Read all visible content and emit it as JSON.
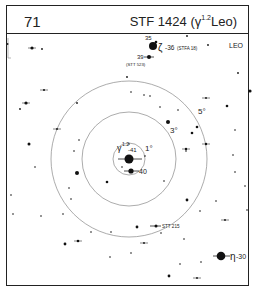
{
  "header": {
    "chart_number": "71",
    "title_prefix": "STF 1424 (",
    "title_greek": "γ",
    "title_sup": "1.2",
    "title_suffix": "Leo)"
  },
  "constellation_label": "LEO",
  "rings": [
    {
      "label": "1°",
      "r": 16
    },
    {
      "label": "3°",
      "r": 47
    },
    {
      "label": "5°",
      "r": 78
    }
  ],
  "center": {
    "x": 129,
    "y": 159
  },
  "labels": {
    "gamma": "γ",
    "gamma_sup": "1.2",
    "gamma_num": "-41",
    "star40": "40",
    "zeta": "ζ",
    "zeta_num": "-36",
    "zeta_note": "(STFA 18)",
    "star35": "35",
    "star39": "39",
    "stt523": "(STT 523)",
    "stt215": "STT 215",
    "eta": "η",
    "eta_num": "-30"
  },
  "stars": [
    {
      "x": 32,
      "y": 48,
      "r": 1.6,
      "cross": true
    },
    {
      "x": 42,
      "y": 49,
      "r": 0.9
    },
    {
      "x": 44,
      "y": 90,
      "r": 1,
      "cross": true
    },
    {
      "x": 26,
      "y": 103,
      "r": 1.6,
      "cross": true
    },
    {
      "x": 20,
      "y": 109,
      "r": 0.9
    },
    {
      "x": 77,
      "y": 103,
      "r": 0.9
    },
    {
      "x": 57,
      "y": 129,
      "r": 0.9,
      "cross": true
    },
    {
      "x": 29,
      "y": 144,
      "r": 1.5
    },
    {
      "x": 79,
      "y": 140,
      "r": 0.8
    },
    {
      "x": 74,
      "y": 151,
      "r": 0.8
    },
    {
      "x": 187,
      "y": 36,
      "r": 0.9
    },
    {
      "x": 208,
      "y": 45,
      "r": 0.9
    },
    {
      "x": 238,
      "y": 73,
      "r": 0.9
    },
    {
      "x": 250,
      "y": 91,
      "r": 1.6
    },
    {
      "x": 127,
      "y": 77,
      "r": 0.9
    },
    {
      "x": 131,
      "y": 92,
      "r": 0.8
    },
    {
      "x": 144,
      "y": 95,
      "r": 0.8
    },
    {
      "x": 150,
      "y": 96,
      "r": 0.8
    },
    {
      "x": 206,
      "y": 98,
      "r": 0.9,
      "cross": true
    },
    {
      "x": 160,
      "y": 107,
      "r": 0.8
    },
    {
      "x": 178,
      "y": 110,
      "r": 0.8
    },
    {
      "x": 227,
      "y": 106,
      "r": 1.3
    },
    {
      "x": 168,
      "y": 122,
      "r": 2
    },
    {
      "x": 197,
      "y": 127,
      "r": 1.3
    },
    {
      "x": 192,
      "y": 133,
      "r": 1.3
    },
    {
      "x": 206,
      "y": 144,
      "r": 1.2,
      "cross": true
    },
    {
      "x": 186,
      "y": 149,
      "r": 1.2,
      "cross": true
    },
    {
      "x": 235,
      "y": 130,
      "r": 0.8
    },
    {
      "x": 233,
      "y": 155,
      "r": 0.8
    },
    {
      "x": 35,
      "y": 167,
      "r": 0.8
    },
    {
      "x": 77,
      "y": 173,
      "r": 2
    },
    {
      "x": 107,
      "y": 182,
      "r": 1.3
    },
    {
      "x": 69,
      "y": 188,
      "r": 0.8
    },
    {
      "x": 71,
      "y": 199,
      "r": 0.8
    },
    {
      "x": 11,
      "y": 195,
      "r": 0.8
    },
    {
      "x": 13,
      "y": 214,
      "r": 0.8
    },
    {
      "x": 41,
      "y": 216,
      "r": 0.8
    },
    {
      "x": 63,
      "y": 214,
      "r": 0.8
    },
    {
      "x": 91,
      "y": 232,
      "r": 0.8
    },
    {
      "x": 111,
      "y": 232,
      "r": 0.8
    },
    {
      "x": 65,
      "y": 244,
      "r": 1.4
    },
    {
      "x": 78,
      "y": 241,
      "r": 1.3,
      "cross": true
    },
    {
      "x": 110,
      "y": 257,
      "r": 0.8
    },
    {
      "x": 137,
      "y": 227,
      "r": 1.4
    },
    {
      "x": 186,
      "y": 151,
      "r": 0.8
    },
    {
      "x": 235,
      "y": 172,
      "r": 0.8
    },
    {
      "x": 245,
      "y": 186,
      "r": 0.8
    },
    {
      "x": 164,
      "y": 181,
      "r": 0.8
    },
    {
      "x": 187,
      "y": 200,
      "r": 1.4
    },
    {
      "x": 216,
      "y": 201,
      "r": 0.8
    },
    {
      "x": 200,
      "y": 211,
      "r": 0.8
    },
    {
      "x": 247,
      "y": 210,
      "r": 0.8
    },
    {
      "x": 225,
      "y": 220,
      "r": 0.9,
      "cross": true
    },
    {
      "x": 184,
      "y": 239,
      "r": 0.8
    },
    {
      "x": 161,
      "y": 233,
      "r": 0.8
    },
    {
      "x": 144,
      "y": 243,
      "r": 0.9,
      "cross": true
    },
    {
      "x": 131,
      "y": 253,
      "r": 0.8
    },
    {
      "x": 180,
      "y": 264,
      "r": 0.8
    },
    {
      "x": 201,
      "y": 262,
      "r": 0.8
    },
    {
      "x": 169,
      "y": 276,
      "r": 1.4
    },
    {
      "x": 197,
      "y": 278,
      "r": 0.9,
      "cross": true
    },
    {
      "x": 129,
      "y": 144,
      "r": 0.8
    },
    {
      "x": 145,
      "y": 156,
      "r": 0.8
    },
    {
      "x": 122,
      "y": 167,
      "r": 0.8
    }
  ]
}
